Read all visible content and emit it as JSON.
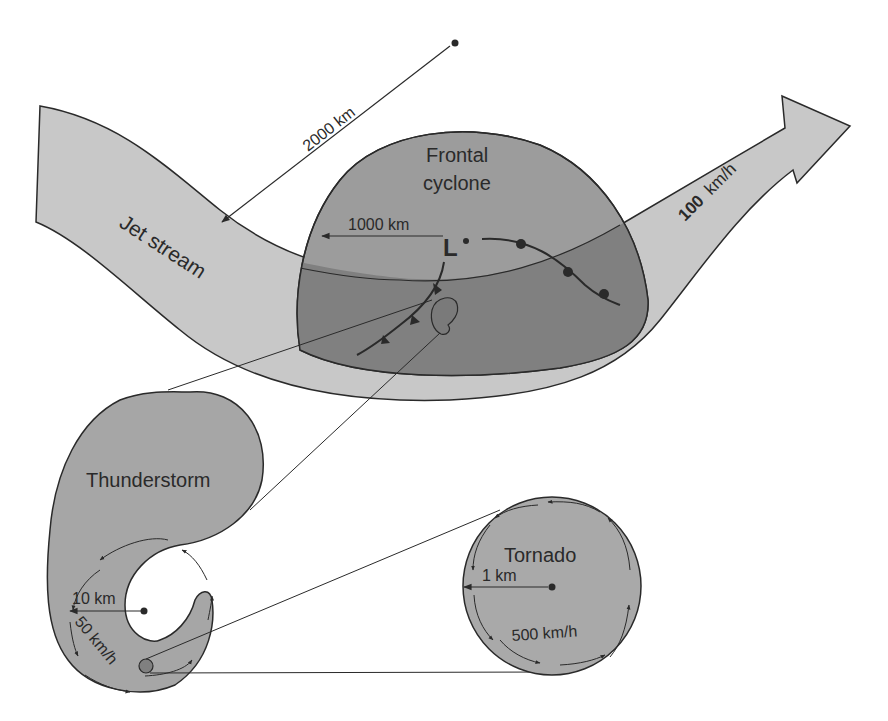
{
  "colors": {
    "background": "#ffffff",
    "jet_stream_fill": "#c8c8c8",
    "cyclone_fill": "#9a9a9a",
    "overlap_fill": "#808080",
    "storm_fill": "#a6a6a6",
    "tornado_fill": "#a9a9a9",
    "stroke": "#2a2a2a"
  },
  "jet_stream": {
    "label": "Jet stream",
    "speed_value": "100",
    "speed_unit": "km/h",
    "scale_label": "2000 km"
  },
  "frontal_cyclone": {
    "title_line1": "Frontal",
    "title_line2": "cyclone",
    "scale_label": "1000 km",
    "low_symbol": "L"
  },
  "thunderstorm": {
    "title": "Thunderstorm",
    "scale_label": "10 km",
    "speed_label": "50 km/h"
  },
  "tornado": {
    "title": "Tornado",
    "scale_label": "1 km",
    "speed_label": "500 km/h"
  }
}
